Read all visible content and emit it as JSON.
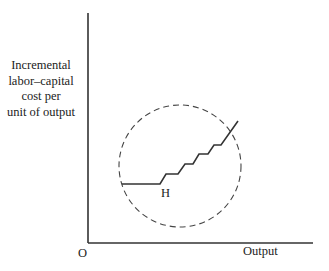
{
  "diagram": {
    "y_axis_label_lines": [
      "Incremental",
      "labor–capital",
      "cost per",
      "unit of output"
    ],
    "x_axis_label": "Output",
    "origin_label": "O",
    "point_label": "H",
    "elements": {
      "axes": {
        "origin": [
          88,
          243
        ],
        "y_top": 13,
        "x_right": 313
      },
      "dashed_circle": {
        "cx": 180,
        "cy": 166,
        "r": 61
      },
      "stepped_cost_curve": [
        [
          122,
          184
        ],
        [
          160,
          184
        ],
        [
          166,
          174
        ],
        [
          178,
          174
        ],
        [
          185,
          164
        ],
        [
          193,
          164
        ],
        [
          199,
          154
        ],
        [
          208,
          154
        ],
        [
          214,
          145
        ],
        [
          221,
          145
        ],
        [
          238,
          121
        ]
      ]
    }
  }
}
